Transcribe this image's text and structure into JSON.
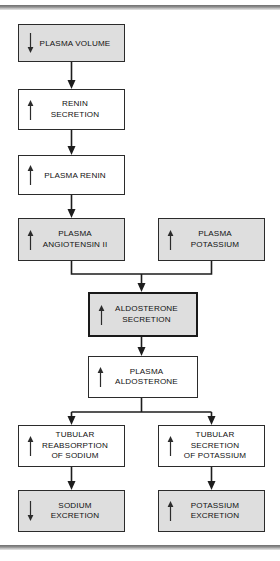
{
  "diagram": {
    "colors": {
      "shaded_fill": "#dedede",
      "plain_fill": "#ffffff",
      "border": "#2b2b2b",
      "heavy_border": "#1a1a1a",
      "connector": "#1d1d1d",
      "rule": "#8e8e8e"
    },
    "nodes": [
      {
        "id": "plasma-volume",
        "label": "PLASMA VOLUME",
        "direction": "down",
        "direction_glyph": "↓",
        "style": "shaded"
      },
      {
        "id": "renin-secretion",
        "label": "RENIN\nSECRETION",
        "direction": "up",
        "direction_glyph": "↑",
        "style": "plain"
      },
      {
        "id": "plasma-renin",
        "label": "PLASMA RENIN",
        "direction": "up",
        "direction_glyph": "↑",
        "style": "plain"
      },
      {
        "id": "plasma-angiotensin-ii",
        "label": "PLASMA\nANGIOTENSIN II",
        "direction": "up",
        "direction_glyph": "↑",
        "style": "shaded"
      },
      {
        "id": "plasma-potassium",
        "label": "PLASMA\nPOTASSIUM",
        "direction": "up",
        "direction_glyph": "↑",
        "style": "shaded"
      },
      {
        "id": "aldosterone-secretion",
        "label": "ALDOSTERONE\nSECRETION",
        "direction": "up",
        "direction_glyph": "↑",
        "style": "shaded-heavy"
      },
      {
        "id": "plasma-aldosterone",
        "label": "PLASMA\nALDOSTERONE",
        "direction": "up",
        "direction_glyph": "↑",
        "style": "plain"
      },
      {
        "id": "tubular-reabsorption-sodium",
        "label": "TUBULAR\nREABSORPTION\nOF SODIUM",
        "direction": "up",
        "direction_glyph": "↑",
        "style": "plain"
      },
      {
        "id": "tubular-secretion-potassium",
        "label": "TUBULAR\nSECRETION\nOF POTASSIUM",
        "direction": "up",
        "direction_glyph": "↑",
        "style": "plain"
      },
      {
        "id": "sodium-excretion",
        "label": "SODIUM\nEXCRETION",
        "direction": "down",
        "direction_glyph": "↓",
        "style": "shaded"
      },
      {
        "id": "potassium-excretion",
        "label": "POTASSIUM\nEXCRETION",
        "direction": "up",
        "direction_glyph": "↑",
        "style": "shaded"
      }
    ],
    "edges": [
      {
        "id": "edge-volume-to-renin-secretion",
        "from": "plasma-volume",
        "to": "renin-secretion",
        "kind": "straight"
      },
      {
        "id": "edge-renin-secretion-to-plasma-renin",
        "from": "renin-secretion",
        "to": "plasma-renin",
        "kind": "straight"
      },
      {
        "id": "edge-plasma-renin-to-angiotensin",
        "from": "plasma-renin",
        "to": "plasma-angiotensin-ii",
        "kind": "straight"
      },
      {
        "id": "edge-angiotensin-to-aldosterone-secretion",
        "from": "plasma-angiotensin-ii",
        "to": "aldosterone-secretion",
        "kind": "merge"
      },
      {
        "id": "edge-potassium-to-aldosterone-secretion",
        "from": "plasma-potassium",
        "to": "aldosterone-secretion",
        "kind": "merge"
      },
      {
        "id": "edge-aldosterone-secretion-to-plasma-aldosterone",
        "from": "aldosterone-secretion",
        "to": "plasma-aldosterone",
        "kind": "straight"
      },
      {
        "id": "edge-plasma-aldosterone-to-tubular-reabsorption",
        "from": "plasma-aldosterone",
        "to": "tubular-reabsorption-sodium",
        "kind": "split"
      },
      {
        "id": "edge-plasma-aldosterone-to-tubular-secretion",
        "from": "plasma-aldosterone",
        "to": "tubular-secretion-potassium",
        "kind": "split"
      },
      {
        "id": "edge-tubular-reabsorption-to-sodium-excretion",
        "from": "tubular-reabsorption-sodium",
        "to": "sodium-excretion",
        "kind": "straight"
      },
      {
        "id": "edge-tubular-secretion-to-potassium-excretion",
        "from": "tubular-secretion-potassium",
        "to": "potassium-excretion",
        "kind": "straight"
      }
    ]
  }
}
